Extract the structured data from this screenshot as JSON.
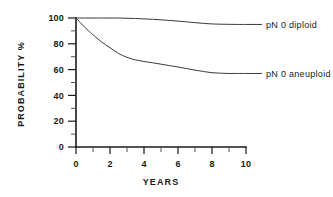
{
  "chart_data": {
    "type": "line",
    "title": "",
    "subtitle": "",
    "xlabel": "YEARS",
    "ylabel": "PROBABILITY %",
    "xlim": [
      0,
      10
    ],
    "ylim": [
      0,
      100
    ],
    "grid": false,
    "legend_position": "right-inline",
    "x_major_ticks": [
      0,
      2,
      4,
      6,
      8,
      10
    ],
    "x_minor_ticks": [
      1,
      3,
      5,
      7,
      9
    ],
    "x_tick_labels": [
      "0",
      "2",
      "4",
      "6",
      "8",
      "10"
    ],
    "y_major_ticks": [
      0,
      20,
      40,
      60,
      80,
      100
    ],
    "y_minor_ticks": [
      10,
      30,
      50,
      70,
      90
    ],
    "y_tick_labels": [
      "0",
      "20",
      "40",
      "60",
      "80",
      "100"
    ],
    "line_color": "#3a3a3a",
    "axis_color": "#1a1a1a",
    "background_color": "#ffffff",
    "series": [
      {
        "name": "pN 0 diploid",
        "label_x": 10.4,
        "label_y": 95.5,
        "x": [
          0,
          0.5,
          1,
          1.5,
          2,
          2.5,
          3,
          3.5,
          4,
          4.5,
          5,
          5.5,
          6,
          6.5,
          7,
          7.5,
          8,
          8.5,
          9,
          9.5,
          10
        ],
        "y": [
          100,
          100,
          100,
          100,
          100,
          100,
          99.8,
          99.6,
          99.3,
          99,
          98.6,
          98.1,
          97.6,
          97,
          96.4,
          95.8,
          95.4,
          95.2,
          95.1,
          95,
          95
        ]
      },
      {
        "name": "pN 0 aneuploid",
        "label_x": 10.4,
        "label_y": 57.5,
        "x": [
          0,
          0.25,
          0.5,
          0.75,
          1,
          1.5,
          2,
          2.5,
          3,
          3.5,
          4,
          4.5,
          5,
          5.5,
          6,
          6.5,
          7,
          7.5,
          8,
          8.5,
          9,
          9.5,
          10
        ],
        "y": [
          100,
          96.5,
          93,
          90,
          87,
          81.5,
          77,
          72.5,
          69.5,
          67.5,
          66.3,
          65.3,
          64.2,
          63.1,
          62,
          60.8,
          59.6,
          58.5,
          57.6,
          57.2,
          57,
          57,
          57
        ]
      }
    ]
  },
  "axis_titles": {
    "x": "YEARS",
    "y": "PROBABILITY %"
  }
}
